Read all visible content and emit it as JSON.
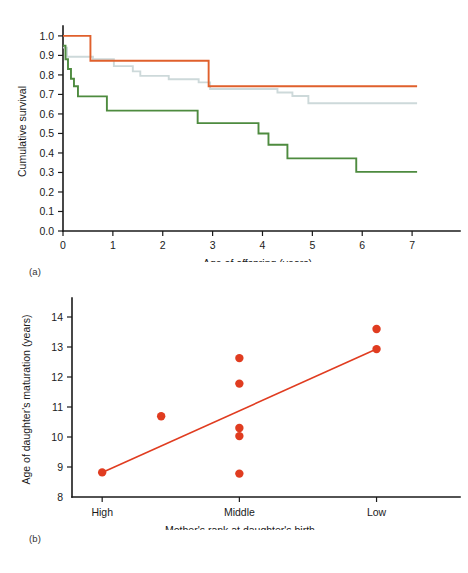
{
  "figure": {
    "panels": [
      {
        "key": "a",
        "label": "(a)"
      },
      {
        "key": "b",
        "label": "(b)"
      }
    ]
  },
  "colors": {
    "orange": "#e0602c",
    "green": "#4e8b3f",
    "grey_blue": "#cdd9da",
    "scatter_red": "#e03c20",
    "fit_red": "#e03c20",
    "axis": "#1a1a1a"
  },
  "chart_data": [
    {
      "type": "line",
      "panel": "a",
      "title": "",
      "xlabel": "Age of offspring (years)",
      "ylabel": "Cumulative survival",
      "xlim": [
        0,
        7.8
      ],
      "ylim": [
        0.0,
        1.02
      ],
      "xticks": [
        0,
        1,
        2,
        3,
        4,
        5,
        6,
        7
      ],
      "xticklabels": [
        "0",
        "1",
        "2",
        "3",
        "4",
        "5",
        "6",
        "7"
      ],
      "yticks": [
        0.0,
        0.1,
        0.2,
        0.3,
        0.4,
        0.5,
        0.6,
        0.7,
        0.8,
        0.9,
        1.0
      ],
      "yticklabels": [
        "0.0",
        "0.1",
        "0.2",
        "0.3",
        "0.4",
        "0.5",
        "0.6",
        "0.7",
        "0.8",
        "0.9",
        "1.0"
      ],
      "grid": false,
      "legend": "none",
      "style": "step-post",
      "series": [
        {
          "name": "high-rank",
          "color": "#e0602c",
          "x": [
            0.0,
            0.55,
            0.55,
            2.92,
            2.92,
            7.1
          ],
          "y": [
            1.0,
            1.0,
            0.873,
            0.873,
            0.742,
            0.742
          ]
        },
        {
          "name": "middle-rank",
          "color": "#cdd9da",
          "x": [
            0.0,
            0.08,
            0.08,
            0.6,
            0.6,
            1.02,
            1.02,
            1.4,
            1.4,
            1.55,
            1.55,
            2.12,
            2.12,
            2.72,
            2.72,
            2.95,
            2.95,
            4.3,
            4.3,
            4.6,
            4.6,
            4.92,
            4.92,
            7.1
          ],
          "y": [
            0.94,
            0.94,
            0.893,
            0.893,
            0.88,
            0.88,
            0.845,
            0.845,
            0.818,
            0.818,
            0.795,
            0.795,
            0.778,
            0.778,
            0.762,
            0.762,
            0.728,
            0.728,
            0.71,
            0.71,
            0.692,
            0.692,
            0.655,
            0.655
          ]
        },
        {
          "name": "low-rank",
          "color": "#4e8b3f",
          "x": [
            0.0,
            0.05,
            0.05,
            0.1,
            0.1,
            0.16,
            0.16,
            0.22,
            0.22,
            0.3,
            0.3,
            0.88,
            0.88,
            2.7,
            2.7,
            3.92,
            3.92,
            4.12,
            4.12,
            4.5,
            4.5,
            5.88,
            5.88,
            7.1
          ],
          "y": [
            0.95,
            0.95,
            0.88,
            0.88,
            0.83,
            0.83,
            0.78,
            0.78,
            0.742,
            0.742,
            0.69,
            0.69,
            0.617,
            0.617,
            0.553,
            0.553,
            0.5,
            0.5,
            0.442,
            0.442,
            0.372,
            0.372,
            0.303,
            0.303
          ]
        }
      ]
    },
    {
      "type": "scatter",
      "panel": "b",
      "title": "",
      "xlabel": "Mother's rank at daughter's birth",
      "ylabel": "Age of daughter's maturation (years)",
      "xlim": [
        -0.22,
        2.55
      ],
      "ylim": [
        8,
        14.5
      ],
      "xticks": [
        0,
        1,
        2
      ],
      "xticklabels": [
        "High",
        "Middle",
        "Low"
      ],
      "yticks": [
        8,
        9,
        10,
        11,
        12,
        13,
        14
      ],
      "yticklabels": [
        "8",
        "9",
        "10",
        "11",
        "12",
        "13",
        "14"
      ],
      "grid": false,
      "legend": "none",
      "points": [
        {
          "x": 0.0,
          "y": 8.82,
          "category": "High"
        },
        {
          "x": 0.43,
          "y": 10.69,
          "category": "between"
        },
        {
          "x": 1.0,
          "y": 12.63,
          "category": "Middle"
        },
        {
          "x": 1.0,
          "y": 11.78,
          "category": "Middle"
        },
        {
          "x": 1.0,
          "y": 10.3,
          "category": "Middle"
        },
        {
          "x": 1.0,
          "y": 10.03,
          "category": "Middle"
        },
        {
          "x": 1.0,
          "y": 8.78,
          "category": "Middle"
        },
        {
          "x": 2.0,
          "y": 13.6,
          "category": "Low"
        },
        {
          "x": 2.0,
          "y": 12.93,
          "category": "Low"
        }
      ],
      "trendline": {
        "name": "regression-line",
        "color": "#e03c20",
        "x": [
          0.0,
          2.0
        ],
        "y": [
          8.82,
          12.93
        ]
      }
    }
  ]
}
